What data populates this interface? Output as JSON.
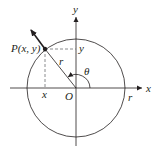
{
  "diagram": {
    "labels": {
      "point": "P(x, y)",
      "x_axis": "x",
      "y_axis": "y",
      "x_coord": "x",
      "y_coord": "y",
      "origin": "O",
      "radius_inner": "r",
      "radius_outer": "r",
      "angle": "θ"
    },
    "colors": {
      "stroke": "#231f20",
      "dashed": "#6d6e71",
      "background": "#ffffff"
    },
    "geometry": {
      "center": [
        76,
        88
      ],
      "radius": 49,
      "point": [
        45,
        49
      ],
      "angle_degrees": 128
    }
  }
}
